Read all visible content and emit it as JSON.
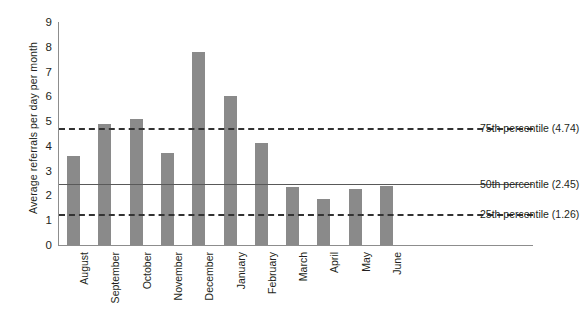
{
  "chart_data": {
    "type": "bar",
    "title": "",
    "xlabel": "",
    "ylabel": "Average referrals per day per month",
    "categories": [
      "August",
      "September",
      "October",
      "November",
      "December",
      "January",
      "February",
      "March",
      "April",
      "May",
      "June"
    ],
    "values": [
      3.6,
      4.9,
      5.1,
      3.7,
      7.8,
      6.0,
      4.1,
      2.35,
      1.85,
      2.25,
      2.4
    ],
    "ylim": [
      0,
      9
    ],
    "yticks": [
      0,
      1,
      2,
      3,
      4,
      5,
      6,
      7,
      8,
      9
    ],
    "ytick_labels": [
      "0",
      "1",
      "2",
      "3",
      "4",
      "5",
      "6",
      "7",
      "8",
      "9"
    ],
    "grid": false,
    "legend": "none",
    "bar_color": "#8a8a8a",
    "reference_lines": [
      {
        "name": "75th percentile",
        "value": 4.74,
        "label": "75th percentile (4.74)",
        "style": "dashed",
        "color": "#333333"
      },
      {
        "name": "50th percentile",
        "value": 2.45,
        "label": "50th percentile (2.45)",
        "style": "solid",
        "color": "#595959"
      },
      {
        "name": "25th percentile",
        "value": 1.26,
        "label": "25th percentile (1.26)",
        "style": "dashed",
        "color": "#333333"
      }
    ]
  }
}
